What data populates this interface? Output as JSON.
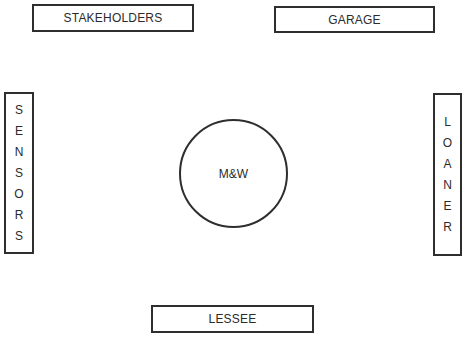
{
  "diagram": {
    "center": {
      "label": "M&W",
      "shape": "circle"
    },
    "nodes": {
      "top_left": {
        "label": "STAKEHOLDERS",
        "orientation": "horizontal"
      },
      "top_right": {
        "label": "GARAGE",
        "orientation": "horizontal"
      },
      "left": {
        "label": "SENSORS",
        "orientation": "vertical",
        "letters": [
          "S",
          "E",
          "N",
          "S",
          "O",
          "R",
          "S"
        ]
      },
      "right": {
        "label": "LOANER",
        "orientation": "vertical",
        "letters": [
          "L",
          "O",
          "A",
          "N",
          "E",
          "R"
        ]
      },
      "bottom": {
        "label": "LESSEE",
        "orientation": "horizontal"
      }
    },
    "colors": {
      "stroke": "#2e2e2e",
      "text": "#2b2b2b",
      "background": "#ffffff"
    }
  }
}
